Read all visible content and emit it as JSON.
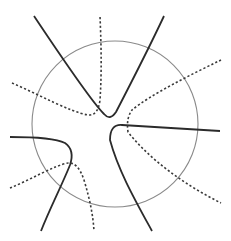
{
  "diagram": {
    "circle": {
      "cx": 115,
      "cy": 124,
      "r": 83,
      "stroke": "#8a8a8a"
    },
    "solid_color": "#2b2b2b",
    "dashed_color": "#3a3a3a",
    "curves": [
      {
        "name": "solid-upper",
        "style": "solid",
        "d": "M34 16 C60 55, 90 100, 104 114 Q110 121, 116 112 C130 85, 148 50, 164 16"
      },
      {
        "name": "dashed-upper",
        "style": "dashed",
        "d": "M12 83 C40 95, 70 112, 88 115 Q98 116, 100 100 C102 70, 101 40, 100 16"
      },
      {
        "name": "solid-right",
        "style": "solid",
        "d": "M220 131 C190 129, 150 127, 122 125 Q110 124, 110 140 C118 170, 135 200, 152 231"
      },
      {
        "name": "dashed-right",
        "style": "dashed",
        "d": "M221 60 C190 75, 150 95, 132 110 Q126 118, 128 132 C150 160, 185 185, 221 203"
      },
      {
        "name": "solid-left",
        "style": "solid",
        "d": "M10 137 C30 137, 55 138, 65 143 Q75 150, 70 165 C62 185, 50 208, 41 231"
      },
      {
        "name": "dashed-left",
        "style": "dashed",
        "d": "M10 188 C30 180, 55 165, 68 163 Q78 162, 84 180 C90 200, 93 215, 94 231"
      }
    ]
  }
}
